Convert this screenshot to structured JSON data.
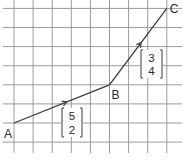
{
  "grid": {
    "origin_x": 14,
    "origin_y": 123,
    "step": 19.1,
    "cols": [
      -1,
      0,
      1,
      2,
      3,
      4,
      5,
      6,
      7,
      8
    ],
    "rows": [
      -1,
      0,
      1,
      2,
      3,
      4,
      5,
      6
    ],
    "h_extent": [
      3,
      182
    ],
    "v_extent": [
      0,
      153
    ],
    "line_color": "#9a9a9a"
  },
  "points": [
    {
      "name": "A",
      "grid": [
        0,
        0
      ],
      "label": "A",
      "label_dx": -10,
      "label_dy": 15
    },
    {
      "name": "B",
      "grid": [
        5,
        2
      ],
      "label": "B",
      "label_dx": 2,
      "label_dy": 14
    },
    {
      "name": "C",
      "grid": [
        8,
        6
      ],
      "label": "C",
      "label_dx": 3,
      "label_dy": 5
    }
  ],
  "vectors": [
    {
      "from": "A",
      "to": "B",
      "components": [
        "5",
        "2"
      ],
      "top": "5",
      "bottom": "2",
      "label_box": {
        "x": 62,
        "y": 108,
        "w": 20,
        "h": 29
      }
    },
    {
      "from": "B",
      "to": "C",
      "components": [
        "3",
        "4"
      ],
      "top": "3",
      "bottom": "4",
      "label_box": {
        "x": 141,
        "y": 50,
        "w": 21,
        "h": 28
      }
    }
  ],
  "labels": {
    "A": "A",
    "B": "B",
    "C": "C",
    "vec_ab_top": "5",
    "vec_ab_bottom": "2",
    "vec_bc_top": "3",
    "vec_bc_bottom": "4"
  }
}
